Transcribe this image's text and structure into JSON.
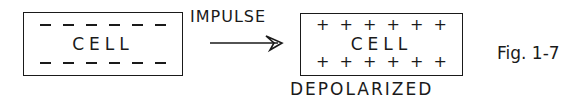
{
  "figure": {
    "caption": "Fig. 1-7",
    "left_cell": {
      "label": "CELL",
      "top_charges": [
        "-",
        "-",
        "-",
        "-",
        "-",
        "-"
      ],
      "bottom_charges": [
        "-",
        "-",
        "-",
        "-",
        "-",
        "-"
      ]
    },
    "arrow": {
      "label": "IMPULSE"
    },
    "right_cell": {
      "label": "CELL",
      "top_charges": [
        "+",
        "+",
        "+",
        "+",
        "+",
        "+"
      ],
      "bottom_charges": [
        "+",
        "+",
        "+",
        "+",
        "+",
        "+"
      ],
      "state_label": "DEPOLARIZED"
    },
    "colors": {
      "ink": "#1a1a1a",
      "background": "#ffffff"
    }
  }
}
